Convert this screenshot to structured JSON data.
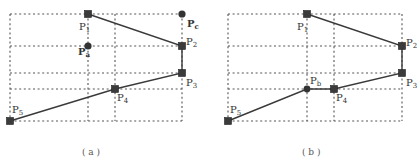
{
  "figure": {
    "panels": [
      {
        "id": "a",
        "caption": "( a )",
        "labels": {
          "p1": {
            "base": "P",
            "sub": "1"
          },
          "p2": {
            "base": "P",
            "sub": "2"
          },
          "p3": {
            "base": "P",
            "sub": "3"
          },
          "p4": {
            "base": "P",
            "sub": "4"
          },
          "p5": {
            "base": "P",
            "sub": "5"
          },
          "pa": {
            "base": "P",
            "sub": "a"
          },
          "pc": {
            "base": "P",
            "sub": "c"
          }
        },
        "polyline": [
          "P1",
          "P2",
          "P3",
          "P4",
          "P5"
        ],
        "extra_points": [
          "Pa",
          "Pc"
        ]
      },
      {
        "id": "b",
        "caption": "( b )",
        "labels": {
          "p1": {
            "base": "P",
            "sub": "1"
          },
          "p2": {
            "base": "P",
            "sub": "2"
          },
          "p3": {
            "base": "P",
            "sub": "3"
          },
          "p4": {
            "base": "P",
            "sub": "4"
          },
          "p5": {
            "base": "P",
            "sub": "5"
          },
          "pb": {
            "base": "P",
            "sub": "b"
          }
        },
        "polyline": [
          "P1",
          "P2",
          "P3",
          "P4",
          "Pb",
          "P5"
        ],
        "extra_points": [
          "Pb"
        ]
      }
    ],
    "colors": {
      "line": "#3a3a3a",
      "grid": "#555555",
      "marker": "#3b3b3b"
    }
  }
}
